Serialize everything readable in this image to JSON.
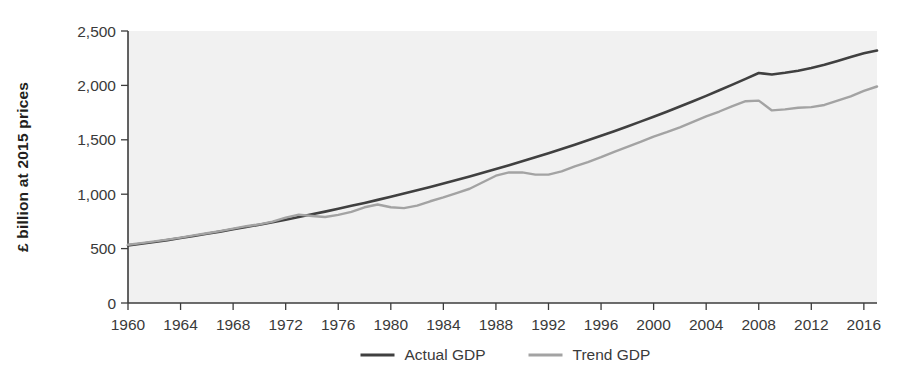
{
  "chart_data": {
    "type": "line",
    "title": "",
    "xlabel": "",
    "ylabel": "£ billion at 2015 prices",
    "xlim": [
      1960,
      2017
    ],
    "ylim": [
      0,
      2500
    ],
    "grid": false,
    "legend_position": "bottom-center",
    "x_ticks": [
      "1960",
      "1964",
      "1968",
      "1972",
      "1976",
      "1980",
      "1984",
      "1988",
      "1992",
      "1996",
      "2000",
      "2004",
      "2008",
      "2012",
      "2016"
    ],
    "x_tick_values": [
      1960,
      1964,
      1968,
      1972,
      1976,
      1980,
      1984,
      1988,
      1992,
      1996,
      2000,
      2004,
      2008,
      2012,
      2016
    ],
    "y_ticks": [
      "0",
      "500",
      "1,000",
      "1,500",
      "2,000",
      "2,500"
    ],
    "y_tick_values": [
      0,
      500,
      1000,
      1500,
      2000,
      2500
    ],
    "x": [
      1960,
      1961,
      1962,
      1963,
      1964,
      1965,
      1966,
      1967,
      1968,
      1969,
      1970,
      1971,
      1972,
      1973,
      1974,
      1975,
      1976,
      1977,
      1978,
      1979,
      1980,
      1981,
      1982,
      1983,
      1984,
      1985,
      1986,
      1987,
      1988,
      1989,
      1990,
      1991,
      1992,
      1993,
      1994,
      1995,
      1996,
      1997,
      1998,
      1999,
      2000,
      2001,
      2002,
      2003,
      2004,
      2005,
      2006,
      2007,
      2008,
      2009,
      2010,
      2011,
      2012,
      2013,
      2014,
      2015,
      2016,
      2017
    ],
    "series": [
      {
        "name": "Actual GDP",
        "color": "#404040",
        "width": 2.6,
        "values": [
          530,
          545,
          560,
          578,
          597,
          616,
          636,
          656,
          677,
          698,
          720,
          743,
          766,
          790,
          815,
          840,
          866,
          893,
          920,
          948,
          977,
          1006,
          1036,
          1067,
          1098,
          1130,
          1163,
          1197,
          1231,
          1266,
          1302,
          1339,
          1377,
          1415,
          1455,
          1495,
          1537,
          1579,
          1622,
          1667,
          1712,
          1758,
          1806,
          1854,
          1904,
          1955,
          2007,
          2060,
          2114,
          2100,
          2116,
          2135,
          2160,
          2190,
          2225,
          2260,
          2295,
          2320
        ]
      },
      {
        "name": "Trend GDP",
        "color": "#a3a3a3",
        "width": 2.4,
        "values": [
          535,
          550,
          566,
          583,
          601,
          622,
          641,
          661,
          684,
          706,
          723,
          748,
          784,
          812,
          800,
          790,
          810,
          838,
          880,
          905,
          880,
          872,
          895,
          935,
          970,
          1010,
          1050,
          1110,
          1170,
          1200,
          1200,
          1180,
          1180,
          1210,
          1255,
          1295,
          1340,
          1390,
          1435,
          1480,
          1530,
          1570,
          1615,
          1665,
          1715,
          1760,
          1810,
          1855,
          1860,
          1770,
          1780,
          1795,
          1800,
          1820,
          1860,
          1900,
          1950,
          1990
        ]
      }
    ],
    "legend": [
      {
        "label": "Actual GDP",
        "color": "#404040"
      },
      {
        "label": "Trend GDP",
        "color": "#a3a3a3"
      }
    ]
  },
  "figure": {
    "background_color": "#ffffff",
    "plot_background_color": "#f1f1f1",
    "axis_color": "#3c3c3c"
  }
}
